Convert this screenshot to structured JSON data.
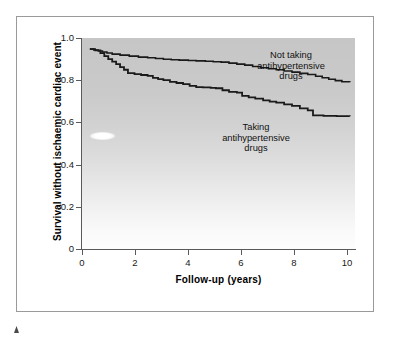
{
  "figure": {
    "background_color": "#ffffff",
    "frame_color": "#9a9a9a",
    "plot_background_top": "#c6c6c6",
    "plot_background_bottom": "#fdfdfd",
    "curve_color": "#1a1a1a"
  },
  "chart_data": {
    "type": "line",
    "subtype": "kaplan-meier-survival-step",
    "title": "",
    "xlabel": "Follow-up (years)",
    "ylabel": "Survival without ischaemic cardiac event",
    "xlim": [
      0,
      10.4
    ],
    "ylim": [
      0,
      1.05
    ],
    "xticks": [
      0,
      2,
      4,
      6,
      8,
      10
    ],
    "xtick_labels": [
      "0",
      "2",
      "4",
      "6",
      "8",
      "10"
    ],
    "yticks": [
      0,
      0.2,
      0.4,
      0.6,
      0.8,
      1.0
    ],
    "ytick_labels": [
      "0",
      "0.2",
      "0.4",
      "0.6",
      "0.8",
      "1.0"
    ],
    "grid": false,
    "legend_position": "inline-annotations",
    "series": [
      {
        "name": "Not taking antihypertensive drugs",
        "label_lines": [
          "Not taking",
          "antihypertensive",
          "drugs"
        ],
        "final_value": 0.83,
        "x": [
          0.3,
          0.45,
          0.62,
          0.78,
          0.95,
          1.15,
          1.45,
          1.8,
          2.15,
          2.5,
          2.8,
          3.1,
          3.4,
          3.7,
          4.05,
          4.35,
          4.7,
          5.0,
          5.3,
          5.6,
          5.9,
          6.2,
          6.5,
          6.8,
          7.1,
          7.4,
          7.7,
          8.0,
          8.3,
          8.6,
          8.9,
          9.15,
          9.4,
          9.65,
          9.9,
          10.2
        ],
        "y": [
          0.995,
          0.99,
          0.985,
          0.98,
          0.975,
          0.97,
          0.965,
          0.96,
          0.955,
          0.952,
          0.948,
          0.944,
          0.942,
          0.94,
          0.938,
          0.936,
          0.934,
          0.932,
          0.93,
          0.925,
          0.92,
          0.915,
          0.908,
          0.902,
          0.897,
          0.892,
          0.886,
          0.88,
          0.874,
          0.868,
          0.86,
          0.852,
          0.845,
          0.838,
          0.832,
          0.83
        ]
      },
      {
        "name": "Taking antihypertensive drugs",
        "label_lines": [
          "Taking",
          "antihypertensive",
          "drugs"
        ],
        "final_value": 0.66,
        "x": [
          0.3,
          0.5,
          0.7,
          0.85,
          1.0,
          1.15,
          1.3,
          1.45,
          1.6,
          1.75,
          2.0,
          2.25,
          2.5,
          2.7,
          2.9,
          3.1,
          3.35,
          3.6,
          3.85,
          4.1,
          4.35,
          4.6,
          4.9,
          5.1,
          5.35,
          5.6,
          5.9,
          6.1,
          6.35,
          6.6,
          6.9,
          7.15,
          7.4,
          7.7,
          8.0,
          8.3,
          8.6,
          8.8,
          9.2,
          9.7,
          10.2
        ],
        "y": [
          0.995,
          0.988,
          0.975,
          0.96,
          0.945,
          0.932,
          0.92,
          0.905,
          0.892,
          0.875,
          0.87,
          0.866,
          0.862,
          0.852,
          0.845,
          0.84,
          0.832,
          0.826,
          0.82,
          0.812,
          0.806,
          0.804,
          0.802,
          0.8,
          0.79,
          0.782,
          0.778,
          0.762,
          0.755,
          0.748,
          0.74,
          0.733,
          0.728,
          0.72,
          0.712,
          0.7,
          0.69,
          0.665,
          0.662,
          0.661,
          0.66
        ]
      }
    ]
  },
  "annotations": {
    "not_taking": "Not taking\nantihypertensive\ndrugs",
    "taking": "Taking\nantihypertensive\ndrugs"
  }
}
